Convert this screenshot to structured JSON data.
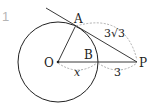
{
  "problem_number": "1",
  "points": {
    "O": "O",
    "A": "A",
    "B": "B",
    "P": "P"
  },
  "lengths": {
    "AP": "3√3",
    "OB": "x",
    "BP": "3"
  },
  "colors": {
    "stroke": "#222222",
    "dashed": "#9a9a9a",
    "number": "#b5b5b5"
  }
}
